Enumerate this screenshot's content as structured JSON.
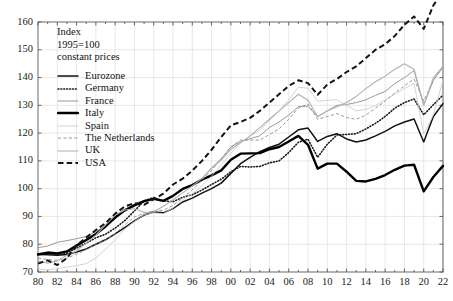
{
  "annotation": {
    "line1": "Index",
    "line2": "1995=100",
    "line3": "constant prices"
  },
  "chart_data": {
    "type": "line",
    "title": "",
    "subtitle": "",
    "xlabel": "",
    "ylabel": "",
    "annotation_lines": [
      "Index",
      "1995=100",
      "constant prices"
    ],
    "grid": true,
    "legend_position": "inside-top-left",
    "xlim": [
      1980,
      2022
    ],
    "ylim": [
      70,
      160
    ],
    "yticks": [
      70,
      80,
      90,
      100,
      110,
      120,
      130,
      140,
      150,
      160
    ],
    "ytick_labels": [
      "70",
      "80",
      "90",
      "100",
      "110",
      "120",
      "130",
      "140",
      "150",
      "160"
    ],
    "xticks": [
      1980,
      1982,
      1984,
      1986,
      1988,
      1990,
      1992,
      1994,
      1996,
      1998,
      2000,
      2002,
      2004,
      2006,
      2008,
      2010,
      2012,
      2014,
      2016,
      2018,
      2020,
      2022
    ],
    "xtick_labels": [
      "80",
      "82",
      "84",
      "86",
      "88",
      "90",
      "92",
      "94",
      "96",
      "98",
      "00",
      "02",
      "04",
      "06",
      "08",
      "10",
      "12",
      "14",
      "16",
      "18",
      "20",
      "22"
    ],
    "x": [
      1980,
      1981,
      1982,
      1983,
      1984,
      1985,
      1986,
      1987,
      1988,
      1989,
      1990,
      1991,
      1992,
      1993,
      1994,
      1995,
      1996,
      1997,
      1998,
      1999,
      2000,
      2001,
      2002,
      2003,
      2004,
      2005,
      2006,
      2007,
      2008,
      2009,
      2010,
      2011,
      2012,
      2013,
      2014,
      2015,
      2016,
      2017,
      2018,
      2019,
      2020,
      2021,
      2022
    ],
    "series": [
      {
        "name": "Eurozone",
        "style": "solid",
        "width": 1.5,
        "color": "#111111",
        "values": [
          76.3,
          76.2,
          76.0,
          76.3,
          77.2,
          78.3,
          80.0,
          81.6,
          83.7,
          86.0,
          88.4,
          90.5,
          91.6,
          91.3,
          92.8,
          95.2,
          96.6,
          98.4,
          100.0,
          102.0,
          105.5,
          109.0,
          111.3,
          113.3,
          114.8,
          116.0,
          118.6,
          121.2,
          121.8,
          117.0,
          118.8,
          119.8,
          117.9,
          116.8,
          117.5,
          119.0,
          120.6,
          122.6,
          124.0,
          125.1,
          116.8,
          126.0,
          130.6
        ]
      },
      {
        "name": "Germany",
        "style": "dotted",
        "width": 1.6,
        "color": "#1a1a1a",
        "values": [
          76.5,
          76.8,
          76.2,
          76.8,
          78.6,
          80.4,
          82.3,
          83.6,
          85.8,
          88.5,
          92.0,
          95.6,
          96.8,
          95.6,
          95.3,
          96.9,
          97.8,
          99.5,
          101.5,
          103.4,
          106.1,
          108.0,
          107.8,
          108.0,
          109.3,
          110.0,
          113.0,
          116.7,
          117.8,
          111.3,
          116.0,
          119.3,
          119.5,
          119.8,
          121.5,
          123.5,
          126.0,
          129.0,
          131.0,
          132.3,
          126.6,
          130.2,
          133.7
        ]
      },
      {
        "name": "France",
        "style": "solid",
        "width": 1.0,
        "color": "#9a9a9a",
        "values": [
          78.8,
          79.3,
          80.7,
          81.3,
          82.0,
          82.8,
          84.6,
          86.5,
          89.1,
          92.4,
          94.6,
          95.6,
          96.5,
          95.6,
          97.4,
          99.6,
          101.4,
          103.7,
          107.5,
          110.8,
          115.0,
          117.0,
          118.0,
          119.0,
          122.0,
          124.0,
          126.5,
          129.5,
          129.7,
          125.9,
          128.0,
          130.0,
          130.3,
          131.0,
          132.0,
          133.6,
          135.0,
          137.8,
          140.0,
          142.5,
          130.1,
          139.0,
          143.7
        ]
      },
      {
        "name": "Italy",
        "style": "solid",
        "width": 2.4,
        "color": "#000000",
        "values": [
          76.3,
          77.0,
          76.7,
          77.4,
          79.5,
          81.5,
          83.7,
          86.4,
          89.6,
          92.2,
          94.0,
          95.5,
          96.3,
          95.6,
          97.4,
          99.9,
          101.3,
          103.2,
          104.8,
          106.6,
          110.4,
          112.6,
          112.7,
          112.8,
          114.2,
          115.0,
          117.0,
          119.0,
          115.8,
          107.2,
          109.0,
          109.0,
          106.1,
          102.8,
          102.6,
          103.5,
          104.9,
          106.8,
          108.3,
          108.6,
          99.0,
          104.2,
          108.2
        ]
      },
      {
        "name": "Spain",
        "style": "solid",
        "width": 0.8,
        "color": "#c8c8c8",
        "values": [
          71.0,
          70.8,
          71.2,
          71.8,
          72.3,
          73.0,
          75.0,
          78.2,
          81.6,
          85.5,
          88.2,
          90.6,
          91.3,
          91.0,
          93.0,
          96.0,
          98.2,
          101.0,
          104.5,
          108.6,
          112.7,
          116.5,
          119.0,
          121.0,
          124.5,
          128.0,
          132.0,
          136.5,
          136.2,
          131.5,
          131.8,
          132.0,
          130.0,
          128.0,
          128.5,
          130.0,
          132.0,
          134.0,
          136.0,
          138.0,
          119.6,
          126.5,
          139.0
        ]
      },
      {
        "name": "The Netherlands",
        "style": "dashed-thin",
        "width": 0.9,
        "color": "#8d8d8d",
        "values": [
          75.0,
          74.5,
          74.2,
          75.0,
          76.4,
          78.1,
          80.0,
          81.6,
          83.8,
          87.0,
          89.8,
          91.2,
          92.0,
          92.2,
          94.0,
          96.6,
          99.5,
          103.0,
          106.5,
          110.7,
          115.0,
          117.5,
          117.5,
          117.5,
          119.5,
          121.5,
          125.0,
          129.0,
          130.5,
          125.0,
          126.0,
          127.0,
          125.6,
          125.0,
          126.5,
          129.0,
          131.5,
          134.5,
          137.0,
          139.5,
          131.5,
          139.0,
          144.0
        ]
      },
      {
        "name": "UK",
        "style": "solid",
        "width": 1.1,
        "color": "#b0b0b0",
        "values": [
          74.0,
          73.2,
          74.0,
          76.0,
          77.6,
          80.4,
          83.3,
          87.0,
          90.5,
          92.3,
          92.8,
          91.5,
          91.6,
          93.7,
          96.0,
          98.5,
          101.0,
          103.6,
          107.3,
          110.3,
          114.2,
          116.5,
          119.0,
          122.0,
          125.0,
          128.0,
          131.0,
          134.0,
          131.8,
          126.0,
          128.0,
          129.5,
          131.0,
          133.2,
          136.0,
          138.5,
          140.5,
          143.0,
          145.0,
          143.0,
          130.0,
          140.0,
          144.0
        ]
      },
      {
        "name": "USA",
        "style": "dashed-bold",
        "width": 2.0,
        "color": "#141414",
        "values": [
          73.0,
          74.2,
          72.5,
          75.0,
          79.6,
          82.4,
          85.1,
          87.6,
          91.0,
          93.6,
          94.8,
          94.2,
          96.2,
          98.2,
          101.5,
          103.6,
          106.5,
          110.0,
          114.0,
          118.6,
          122.8,
          124.0,
          125.5,
          128.0,
          131.0,
          134.0,
          137.0,
          139.0,
          138.0,
          133.8,
          137.5,
          139.5,
          142.0,
          144.0,
          147.0,
          150.0,
          152.0,
          155.0,
          159.0,
          162.0,
          157.5,
          166.0,
          171.0
        ]
      }
    ]
  },
  "legend": {
    "items": [
      {
        "label": "Eurozone",
        "key": "line-key-solid"
      },
      {
        "label": "Germany",
        "key": "line-key-dotted"
      },
      {
        "label": "France",
        "key": "line-key-light-solid"
      },
      {
        "label": "Italy",
        "key": "line-key-thick-solid"
      },
      {
        "label": "Spain",
        "key": "line-key-very-light"
      },
      {
        "label": "The Netherlands",
        "key": "line-key-thin-dashed"
      },
      {
        "label": "UK",
        "key": "line-key-gray-solid"
      },
      {
        "label": "USA",
        "key": "line-key-bold-dashed"
      }
    ]
  },
  "colors": {
    "axis": "#5a5a5a",
    "grid": "#dedede",
    "text": "#111111",
    "background": "#ffffff"
  }
}
